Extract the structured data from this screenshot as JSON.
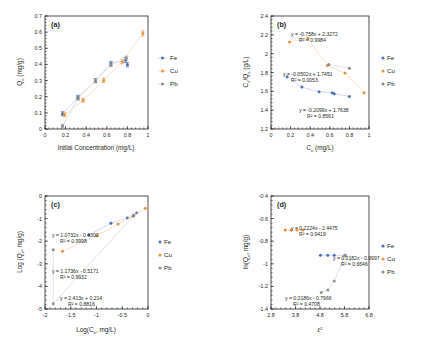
{
  "figure": {
    "panels": [
      "a",
      "b",
      "c",
      "d"
    ],
    "colors": {
      "Fe": "#4a6fb5",
      "Cu": "#e8943a",
      "Pb": "#8a8c8e",
      "axis": "#231f20",
      "trend_fe": "#c6d3e8",
      "trend_cu": "#f5dcc0",
      "trend_pb": "#d8d9da"
    },
    "legend_entries": [
      "Fe",
      "Cu",
      "Pb"
    ]
  },
  "chart_data": [
    {
      "panel": "a",
      "type": "scatter",
      "title": "(a)",
      "xlabel": "Initial Concentration (mg/L)",
      "ylabel": "Qe (mg/g)",
      "ylabel_base": "Q",
      "ylabel_sub": "e",
      "ylabel_unit": " (mg/g)",
      "xlim": [
        0,
        1
      ],
      "ylim": [
        0,
        0.7
      ],
      "xticks": [
        0,
        0.2,
        0.4,
        0.6,
        0.8,
        1
      ],
      "xticklabels": [
        "0",
        "0.2",
        "0.4",
        "0.6",
        "0.8",
        "1"
      ],
      "yticks": [
        0,
        0.1,
        0.2,
        0.3,
        0.4,
        0.5,
        0.6,
        0.7
      ],
      "yticklabels": [
        "0",
        "0.1",
        "0.2",
        "0.3",
        "0.4",
        "0.5",
        "0.6",
        "0.7"
      ],
      "grid": false,
      "legend_position": "right",
      "series": [
        {
          "name": "Fe",
          "x": [
            0.17,
            0.32,
            0.49,
            0.64,
            0.78,
            0.8
          ],
          "y": [
            0.095,
            0.197,
            0.299,
            0.405,
            0.428,
            0.398
          ],
          "yerr": [
            0.012,
            0.012,
            0.012,
            0.014,
            0.015,
            0.013
          ]
        },
        {
          "name": "Cu",
          "x": [
            0.19,
            0.37,
            0.57,
            0.75,
            0.95
          ],
          "y": [
            0.088,
            0.178,
            0.302,
            0.418,
            0.592
          ],
          "yerr": [
            0.012,
            0.012,
            0.013,
            0.014,
            0.016
          ]
        },
        {
          "name": "Pb",
          "x": [
            0.17,
            0.32,
            0.49,
            0.64,
            0.79
          ],
          "y": [
            0.018,
            0.19,
            0.3,
            0.4,
            0.437
          ],
          "yerr": [
            0.01,
            0.012,
            0.012,
            0.013,
            0.014
          ]
        }
      ]
    },
    {
      "panel": "b",
      "type": "scatter",
      "title": "(b)",
      "xlabel": "Ce (mg/L)",
      "xlabel_base": "C",
      "xlabel_sub": "e",
      "xlabel_unit": " (mg/L)",
      "ylabel": "Ce/Qe (g/L)",
      "ylabel_base": "C",
      "ylabel_sub": "e",
      "ylabel_base2": "/Q",
      "ylabel_sub2": "e",
      "ylabel_unit": " (g/L)",
      "xlim": [
        0,
        1
      ],
      "ylim": [
        1.2,
        2.4
      ],
      "xticks": [
        0,
        0.2,
        0.4,
        0.6,
        0.8,
        1
      ],
      "xticklabels": [
        "0",
        "0.2",
        "0.4",
        "0.6",
        "0.8",
        "1"
      ],
      "yticks": [
        1.2,
        1.4,
        1.6,
        1.8,
        2.0,
        2.2,
        2.4
      ],
      "yticklabels": [
        "1.2",
        "1.4",
        "1.6",
        "1.8",
        "2",
        "2.2",
        "2.4"
      ],
      "grid": false,
      "legend_position": "right",
      "annotations": [
        {
          "id": "eq-pb",
          "line1": "y = -0.758x + 2.3272",
          "line2": "R² = 0.9984"
        },
        {
          "id": "eq-fe",
          "line1": "y = -0.0502x + 1.7451",
          "line2": "R² = 0.0053"
        },
        {
          "id": "eq-cu",
          "line1": "y = -0.2099x + 1.7638",
          "line2": "R² = 0.8561"
        }
      ],
      "series": [
        {
          "name": "Fe",
          "x": [
            0.165,
            0.315,
            0.49,
            0.625,
            0.645,
            0.8
          ],
          "y": [
            1.755,
            1.645,
            1.595,
            1.585,
            1.575,
            1.545
          ]
        },
        {
          "name": "Cu",
          "x": [
            0.19,
            0.375,
            0.575,
            0.755,
            0.95
          ],
          "y": [
            2.125,
            2.165,
            1.875,
            1.795,
            1.585
          ]
        },
        {
          "name": "Pb",
          "x": [
            0.59,
            0.8
          ],
          "y": [
            1.885,
            1.845
          ]
        }
      ]
    },
    {
      "panel": "c",
      "type": "scatter",
      "title": "(c)",
      "xlabel": "Log(Ce, mg/L)",
      "xlabel_base": "Log(C",
      "xlabel_sub": "e",
      "xlabel_unit": ", mg/L)",
      "ylabel": "Log (Qe, mg/g)",
      "ylabel_base": "Log (Q",
      "ylabel_sub": "e",
      "ylabel_unit": ", mg/g)",
      "xlim": [
        -2,
        0
      ],
      "ylim": [
        -5,
        0
      ],
      "xticks": [
        -2,
        -1.5,
        -1,
        -0.5,
        0
      ],
      "xticklabels": [
        "-2",
        "-1.5",
        "-1",
        "-0.5",
        "0"
      ],
      "yticks": [
        -5,
        -4,
        -3,
        -2,
        -1,
        0
      ],
      "yticklabels": [
        "-5",
        "-4",
        "-3",
        "-2",
        "-1",
        "0"
      ],
      "grid": false,
      "legend_position": "right",
      "annotations": [
        {
          "id": "eq-fe",
          "line1": "y = 1.0732x - 0.4303",
          "line2": "R² = 0.9998"
        },
        {
          "id": "eq-cu",
          "line1": "y = 1.1736x - 0.5171",
          "line2": "R² = 0.9932"
        },
        {
          "id": "eq-pb",
          "line1": "y = 2.413x + 0.214",
          "line2": "R² = 0.8816"
        }
      ],
      "series": [
        {
          "name": "Fe",
          "x": [
            -1.15,
            -0.72,
            -0.4,
            -0.28,
            -0.22
          ],
          "y": [
            -1.73,
            -1.21,
            -0.97,
            -0.85,
            -0.75
          ]
        },
        {
          "name": "Cu",
          "x": [
            -1.66,
            -1.0,
            -0.58,
            -0.29,
            -0.05
          ],
          "y": [
            -2.44,
            -1.76,
            -1.24,
            -0.9,
            -0.54
          ]
        },
        {
          "name": "Pb",
          "x": [
            -1.84,
            -1.84,
            -0.28
          ],
          "y": [
            -2.38,
            -4.77,
            -0.87
          ]
        }
      ]
    },
    {
      "panel": "d",
      "type": "scatter",
      "title": "(d)",
      "xlabel": "ε²",
      "xlabel_base": "ε",
      "xlabel_sup": "2",
      "ylabel": "ln(Qe, mg/g)",
      "ylabel_base": "ln(Q",
      "ylabel_sub": "e",
      "ylabel_unit": ", mg/g)",
      "xlim": [
        2.8,
        6.8
      ],
      "ylim": [
        -1.4,
        -0.4
      ],
      "xticks": [
        2.8,
        3.8,
        4.8,
        5.8,
        6.8
      ],
      "xticklabels": [
        "2.8",
        "3.8",
        "4.8",
        "5.8",
        "6.8"
      ],
      "yticks": [
        -1.4,
        -1.2,
        -1.0,
        -0.8,
        -0.6,
        -0.4
      ],
      "yticklabels": [
        "-1.4",
        "-1.2",
        "-1",
        "-0.8",
        "-0.6",
        "-0.4"
      ],
      "grid": false,
      "legend_position": "right",
      "annotations": [
        {
          "id": "eq-pb",
          "line1": "y = 0.2224x - 2.4475",
          "line2": "R² = 0.9419"
        },
        {
          "id": "eq-fe",
          "line1": "y = 0.0182x - 0.9997",
          "line2": "R² = 0.6646"
        },
        {
          "id": "eq-cu",
          "line1": "y = 0.0186x - 0.7966",
          "line2": "R² = 0.4708"
        }
      ],
      "series": [
        {
          "name": "Fe",
          "x": [
            4.82,
            5.12,
            5.38,
            5.82
          ],
          "y": [
            -0.925,
            -0.925,
            -0.925,
            -0.925
          ]
        },
        {
          "name": "Cu",
          "x": [
            3.38,
            3.62,
            3.86,
            4.1
          ],
          "y": [
            -0.7,
            -0.7,
            -0.7,
            -0.7
          ]
        },
        {
          "name": "Pb",
          "x": [
            4.85,
            5.12,
            5.38,
            5.82
          ],
          "y": [
            -1.255,
            -1.232,
            -1.152,
            -0.925
          ]
        }
      ]
    }
  ]
}
